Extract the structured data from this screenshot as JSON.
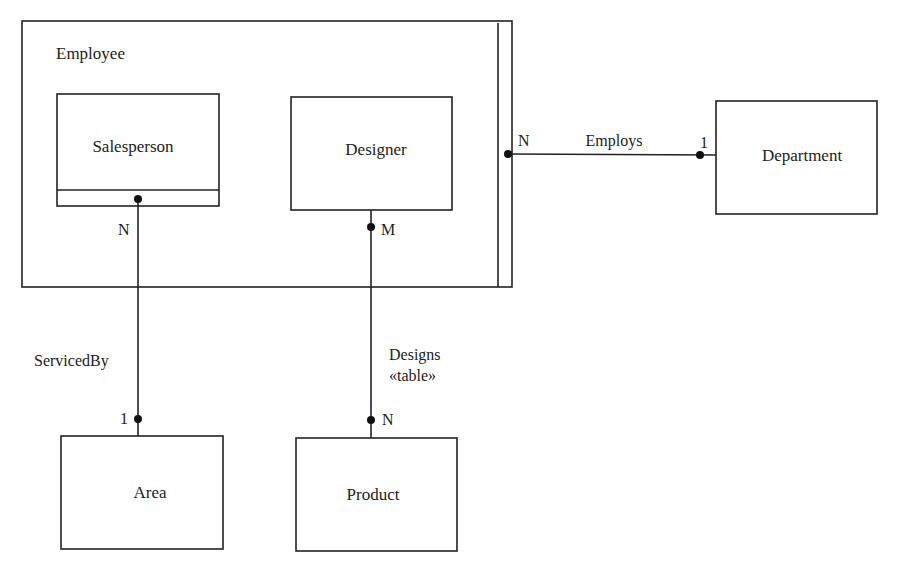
{
  "diagram": {
    "type": "entity-relationship",
    "colors": {
      "stroke": "#222222",
      "background": "#ffffff",
      "text": "#222222"
    },
    "supertype": {
      "label": "Employee",
      "subtypes": [
        "Salesperson",
        "Designer"
      ]
    },
    "entities": {
      "employee": "Employee",
      "salesperson": "Salesperson",
      "designer": "Designer",
      "department": "Department",
      "area": "Area",
      "product": "Product"
    },
    "relationships": {
      "employs": {
        "label": "Employs",
        "from": "Employee",
        "to": "Department",
        "from_card": "N",
        "to_card": "1"
      },
      "serviced_by": {
        "label": "ServicedBy",
        "from": "Salesperson",
        "to": "Area",
        "from_card": "N",
        "to_card": "1"
      },
      "designs": {
        "label": "Designs",
        "stereotype": "«table»",
        "from": "Designer",
        "to": "Product",
        "from_card": "M",
        "to_card": "N"
      }
    }
  }
}
